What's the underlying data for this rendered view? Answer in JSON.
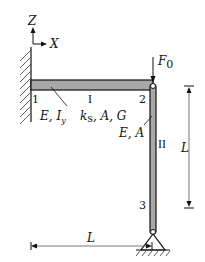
{
  "diagram": {
    "axes": {
      "z_label": "Z",
      "x_label": "X"
    },
    "beam": {
      "id": "I",
      "properties": "E, I_y  k_s, A, G",
      "props_left": "E, I",
      "props_left_sub": "y",
      "props_right": "k",
      "props_right_sub": "s",
      "props_right_rest": ", A, G",
      "fill_color": "#a8a8a8"
    },
    "column": {
      "id": "II",
      "properties": "E, A",
      "fill_color": "#a8a8a8"
    },
    "nodes": [
      {
        "label": "1"
      },
      {
        "label": "2"
      },
      {
        "label": "3"
      }
    ],
    "load": {
      "label": "F",
      "sub": "0"
    },
    "dimensions": {
      "vertical": {
        "label": "L"
      },
      "horizontal": {
        "label": "L"
      }
    }
  }
}
